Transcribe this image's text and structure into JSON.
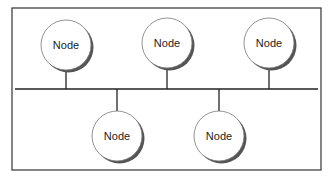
{
  "diagram": {
    "type": "bus-topology",
    "frame": {
      "x": 12,
      "y": 8,
      "width": 309,
      "height": 162,
      "stroke": "#333333"
    },
    "bus": {
      "y": 89,
      "x1": 15,
      "x2": 318,
      "stroke": "#222222"
    },
    "nodes": [
      {
        "label": "Node",
        "cx": 66,
        "cy": 45,
        "r": 25,
        "side": "top"
      },
      {
        "label": "Node",
        "cx": 167,
        "cy": 43,
        "r": 25,
        "side": "top"
      },
      {
        "label": "Node",
        "cx": 269,
        "cy": 43,
        "r": 25,
        "side": "top"
      },
      {
        "label": "Node",
        "cx": 117,
        "cy": 136,
        "r": 25,
        "side": "bottom"
      },
      {
        "label": "Node",
        "cx": 219,
        "cy": 136,
        "r": 25,
        "side": "bottom"
      }
    ],
    "colors": {
      "node_fill": "#ffffff",
      "node_stroke": "#777777",
      "shadow": "#555555",
      "line": "#222222"
    }
  }
}
